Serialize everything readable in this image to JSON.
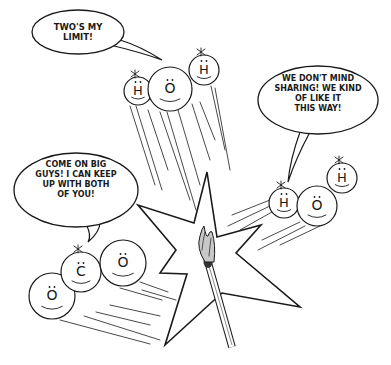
{
  "colors": {
    "ink": "#1a1a1a",
    "paper": "#ffffff",
    "flame": "#c8c8c8"
  },
  "bubbles": [
    {
      "id": "hydrogen-top",
      "cx": 78,
      "cy": 32,
      "rx": 46,
      "ry": 22,
      "tail": "M 110 45 Q 140 52 162 60 Q 140 46 120 40",
      "lines": [
        "TWO'S MY",
        "LIMIT!"
      ],
      "font_size": 8.5,
      "line_height": 10,
      "text_y": 30
    },
    {
      "id": "water-right",
      "cx": 318,
      "cy": 100,
      "rx": 60,
      "ry": 34,
      "tail": "M 300 132 Q 290 160 288 182 Q 296 158 310 132",
      "lines": [
        "WE DON'T MIND",
        "SHARING! WE KIND",
        "OF LIKE IT",
        "THIS WAY!"
      ],
      "font_size": 8,
      "line_height": 10,
      "text_y": 81
    },
    {
      "id": "carbon-left",
      "cx": 76,
      "cy": 190,
      "rx": 62,
      "ry": 37,
      "tail": "M 86 224 Q 92 236 88 242 Q 100 232 100 222",
      "lines": [
        "COME ON BIG",
        "GUYS! I CAN KEEP",
        "UP WITH BOTH",
        "OF YOU!"
      ],
      "font_size": 8,
      "line_height": 10,
      "text_y": 167
    }
  ],
  "molecules": [
    {
      "name": "water-top",
      "atoms": [
        {
          "symbol": "H",
          "cx": 138,
          "cy": 91,
          "r": 14,
          "spark": true
        },
        {
          "symbol": "O",
          "cx": 170,
          "cy": 89,
          "r": 22,
          "spark": false
        },
        {
          "symbol": "H",
          "cx": 204,
          "cy": 70,
          "r": 15,
          "spark": true
        }
      ]
    },
    {
      "name": "water-right",
      "atoms": [
        {
          "symbol": "H",
          "cx": 284,
          "cy": 203,
          "r": 15,
          "spark": true
        },
        {
          "symbol": "O",
          "cx": 317,
          "cy": 206,
          "r": 20,
          "spark": false
        },
        {
          "symbol": "H",
          "cx": 342,
          "cy": 178,
          "r": 15,
          "spark": true
        }
      ]
    },
    {
      "name": "carbon-dioxide",
      "atoms": [
        {
          "symbol": "O",
          "cx": 52,
          "cy": 296,
          "r": 23,
          "spark": false
        },
        {
          "symbol": "C",
          "cx": 81,
          "cy": 272,
          "r": 20,
          "spark": true
        },
        {
          "symbol": "O",
          "cx": 123,
          "cy": 263,
          "r": 23,
          "spark": false
        }
      ]
    }
  ],
  "star": "207,172 194,223 138,205 176,250 160,273 187,274 165,345 212,302 222,293 300,307 236,253 261,225 217,237",
  "match": {
    "x1": 208,
    "y1": 262,
    "x2": 232,
    "y2": 347,
    "width": 6
  },
  "flame": "M 205 262 Q 196 248 200 236 Q 202 228 204 226 Q 206 238 208 236 Q 210 230 212 232 Q 216 244 214 262 Z",
  "motion_lines": [
    [
      130,
      106,
      155,
      185
    ],
    [
      136,
      106,
      162,
      190
    ],
    [
      148,
      110,
      168,
      170
    ],
    [
      160,
      112,
      190,
      200
    ],
    [
      167,
      112,
      196,
      210
    ],
    [
      178,
      110,
      200,
      185
    ],
    [
      192,
      104,
      210,
      160
    ],
    [
      200,
      102,
      215,
      140
    ],
    [
      211,
      86,
      225,
      150
    ],
    [
      215,
      88,
      230,
      170
    ],
    [
      270,
      200,
      232,
      215
    ],
    [
      270,
      206,
      228,
      226
    ],
    [
      272,
      212,
      240,
      230
    ],
    [
      300,
      222,
      262,
      240
    ],
    [
      305,
      226,
      258,
      250
    ],
    [
      320,
      226,
      280,
      245
    ],
    [
      140,
      282,
      168,
      292
    ],
    [
      142,
      290,
      176,
      300
    ],
    [
      120,
      288,
      162,
      300
    ],
    [
      110,
      305,
      160,
      316
    ],
    [
      96,
      312,
      150,
      325
    ],
    [
      84,
      316,
      160,
      340
    ],
    [
      60,
      320,
      150,
      344
    ]
  ]
}
